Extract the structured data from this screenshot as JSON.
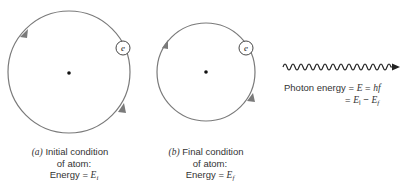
{
  "panel_a": {
    "label": "(a)",
    "caption_line1": "Initial condition",
    "caption_line2": "of atom:",
    "energy_prefix": "Energy = ",
    "energy_symbol": "E",
    "energy_sub": "i",
    "electron_label": "e"
  },
  "panel_b": {
    "label": "(b)",
    "caption_line1": "Final condition",
    "caption_line2": "of atom:",
    "energy_prefix": "Energy = ",
    "energy_symbol": "E",
    "energy_sub": "f",
    "electron_label": "e"
  },
  "photon": {
    "prefix": "Photon energy = ",
    "E": "E",
    "eq": " = ",
    "hf": "hf",
    "line2_eq": "= ",
    "Ei": "E",
    "Ei_sub": "i",
    "minus": " − ",
    "Ef": "E",
    "Ef_sub": "f"
  },
  "colors": {
    "orbit": "#7a7a7a",
    "nucleus": "#111111",
    "wave": "#222222"
  }
}
